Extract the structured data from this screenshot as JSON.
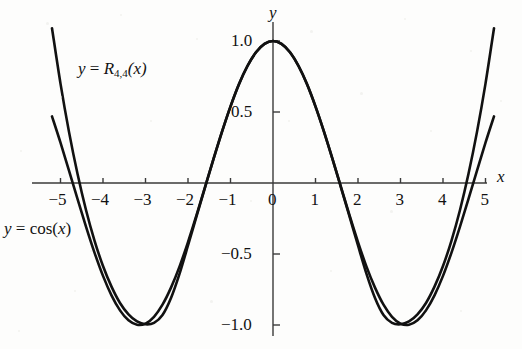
{
  "figure": {
    "background_color": "#fdfdfc",
    "curve_color": "#111111",
    "axis_color": "#3a3a3a"
  },
  "axes": {
    "x_axis_name": "x",
    "y_axis_name": "y",
    "x_ticks": [
      {
        "value": -5,
        "label": "−5"
      },
      {
        "value": -4,
        "label": "−4"
      },
      {
        "value": -3,
        "label": "−3"
      },
      {
        "value": -2,
        "label": "−2"
      },
      {
        "value": -1,
        "label": "−1"
      },
      {
        "value": 0,
        "label": "0"
      },
      {
        "value": 1,
        "label": "1"
      },
      {
        "value": 2,
        "label": "2"
      },
      {
        "value": 3,
        "label": "3"
      },
      {
        "value": 4,
        "label": "4"
      },
      {
        "value": 5,
        "label": "5"
      }
    ],
    "y_ticks": [
      {
        "value": 1.0,
        "label": "1.0"
      },
      {
        "value": 0.5,
        "label": "0.5"
      },
      {
        "value": -0.5,
        "label": "−0.5"
      },
      {
        "value": -1.0,
        "label": "−1.0"
      }
    ]
  },
  "labels": {
    "rational_pre": "y",
    "rational_eq": " = ",
    "rational_R": "R",
    "rational_sub": "4,4",
    "rational_post": "(x)",
    "cos_pre": "y",
    "cos_eq": " = ",
    "cos_fn": "cos(",
    "cos_var": "x",
    "cos_close": ")"
  },
  "chart_data": {
    "type": "line",
    "title": "",
    "xlabel": "x",
    "ylabel": "y",
    "xlim": [
      -5.2,
      5.2
    ],
    "ylim": [
      -1.45,
      1.12
    ],
    "grid": false,
    "legend": "inline-annotations",
    "annotations": [
      {
        "text": "y = R_{4,4}(x)",
        "x": -4.0,
        "y": 0.78
      },
      {
        "text": "y = cos(x)",
        "x": -5.1,
        "y": -0.33
      }
    ],
    "series": [
      {
        "name": "y = cos(x)",
        "x": [
          -5.2,
          -5.0,
          -4.8,
          -4.6,
          -4.4,
          -4.2,
          -4.0,
          -3.8,
          -3.6,
          -3.4,
          -3.2,
          -3.0,
          -2.8,
          -2.6,
          -2.4,
          -2.2,
          -2.0,
          -1.8,
          -1.6,
          -1.4,
          -1.2,
          -1.0,
          -0.8,
          -0.6,
          -0.4,
          -0.2,
          0.0,
          0.2,
          0.4,
          0.6,
          0.8,
          1.0,
          1.2,
          1.4,
          1.6,
          1.8,
          2.0,
          2.2,
          2.4,
          2.6,
          2.8,
          3.0,
          3.2,
          3.4,
          3.6,
          3.8,
          4.0,
          4.2,
          4.4,
          4.6,
          4.8,
          5.0,
          5.2
        ],
        "y": [
          0.469,
          0.284,
          0.087,
          -0.112,
          -0.307,
          -0.49,
          -0.654,
          -0.791,
          -0.897,
          -0.967,
          -0.998,
          -0.99,
          -0.942,
          -0.857,
          -0.737,
          -0.589,
          -0.416,
          -0.227,
          -0.029,
          0.17,
          0.362,
          0.54,
          0.697,
          0.825,
          0.921,
          0.98,
          1.0,
          0.98,
          0.921,
          0.825,
          0.697,
          0.54,
          0.362,
          0.17,
          -0.029,
          -0.227,
          -0.416,
          -0.589,
          -0.737,
          -0.857,
          -0.942,
          -0.99,
          -0.998,
          -0.967,
          -0.897,
          -0.791,
          -0.654,
          -0.49,
          -0.307,
          -0.112,
          0.087,
          0.284,
          0.469
        ]
      },
      {
        "name": "y = R_4,4(x)",
        "note": "Pade [4/4] rational approximation to cos(x); matches cos closely on |x|<4 and diverges upward near |x|=5",
        "x": [
          -5.2,
          -5.0,
          -4.8,
          -4.6,
          -4.4,
          -4.2,
          -4.0,
          -3.8,
          -3.6,
          -3.4,
          -3.2,
          -3.0,
          -2.8,
          -2.6,
          -2.4,
          -2.2,
          -2.0,
          -1.8,
          -1.6,
          -1.4,
          -1.2,
          -1.0,
          -0.8,
          -0.6,
          -0.4,
          -0.2,
          0.0,
          0.2,
          0.4,
          0.6,
          0.8,
          1.0,
          1.2,
          1.4,
          1.6,
          1.8,
          2.0,
          2.2,
          2.4,
          2.6,
          2.8,
          3.0,
          3.2,
          3.4,
          3.6,
          3.8,
          4.0,
          4.2,
          4.4,
          4.6,
          4.8,
          5.0,
          5.2
        ],
        "y": [
          1.09,
          0.7,
          0.36,
          0.065,
          -0.19,
          -0.405,
          -0.585,
          -0.73,
          -0.845,
          -0.925,
          -0.975,
          -0.995,
          -0.985,
          -0.93,
          -0.81,
          -0.64,
          -0.44,
          -0.235,
          -0.032,
          0.168,
          0.36,
          0.538,
          0.696,
          0.824,
          0.921,
          0.98,
          1.0,
          0.98,
          0.921,
          0.824,
          0.696,
          0.538,
          0.36,
          0.168,
          -0.032,
          -0.235,
          -0.44,
          -0.64,
          -0.81,
          -0.93,
          -0.985,
          -0.995,
          -0.975,
          -0.925,
          -0.845,
          -0.73,
          -0.585,
          -0.405,
          -0.19,
          0.065,
          0.36,
          0.7,
          1.09
        ]
      }
    ]
  }
}
